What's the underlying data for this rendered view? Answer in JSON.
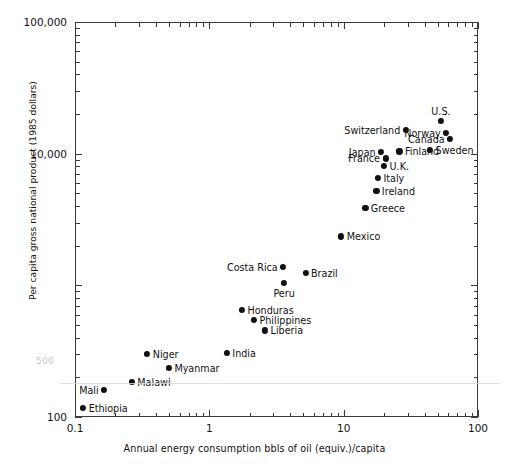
{
  "chart_data": {
    "type": "scatter",
    "title": "",
    "xlabel": "Annual energy consumption bbls of oil (equiv.)/capita",
    "ylabel": "Per capita gross national product (1985 dollars)",
    "xscale": "log",
    "yscale": "log",
    "xlim": [
      0.1,
      100
    ],
    "ylim": [
      100,
      100000
    ],
    "xticks": [
      "0.1",
      "1",
      "10",
      "100"
    ],
    "yticks": [
      "100",
      "1000",
      "10,000",
      "100,000"
    ],
    "ytick_labels_shown": [
      "100",
      "10,000",
      "100,000"
    ],
    "grid": false,
    "legend": false,
    "points": [
      {
        "name": "Ethiopia",
        "x": 0.115,
        "y": 118,
        "side": "right"
      },
      {
        "name": "Mali",
        "x": 0.165,
        "y": 160,
        "side": "left"
      },
      {
        "name": "Malawi",
        "x": 0.265,
        "y": 185,
        "side": "right"
      },
      {
        "name": "Myanmar",
        "x": 0.5,
        "y": 235,
        "side": "right"
      },
      {
        "name": "Niger",
        "x": 0.345,
        "y": 300,
        "side": "right"
      },
      {
        "name": "India",
        "x": 1.35,
        "y": 305,
        "side": "right"
      },
      {
        "name": "Liberia",
        "x": 2.6,
        "y": 455,
        "side": "right"
      },
      {
        "name": "Philippines",
        "x": 2.15,
        "y": 545,
        "side": "right"
      },
      {
        "name": "Honduras",
        "x": 1.75,
        "y": 650,
        "side": "right"
      },
      {
        "name": "Peru",
        "x": 3.6,
        "y": 1050,
        "side": "below"
      },
      {
        "name": "Costa Rica",
        "x": 3.55,
        "y": 1380,
        "side": "left"
      },
      {
        "name": "Brazil",
        "x": 5.2,
        "y": 1250,
        "side": "right"
      },
      {
        "name": "Mexico",
        "x": 9.6,
        "y": 2350,
        "side": "right"
      },
      {
        "name": "Greece",
        "x": 14.5,
        "y": 3900,
        "side": "right"
      },
      {
        "name": "Ireland",
        "x": 17.5,
        "y": 5200,
        "side": "right"
      },
      {
        "name": "Italy",
        "x": 18.0,
        "y": 6500,
        "side": "right"
      },
      {
        "name": "U.K.",
        "x": 20.0,
        "y": 8100,
        "side": "right"
      },
      {
        "name": "France",
        "x": 20.5,
        "y": 9200,
        "side": "left"
      },
      {
        "name": "Japan",
        "x": 19.0,
        "y": 10300,
        "side": "left"
      },
      {
        "name": "Finland",
        "x": 26.0,
        "y": 10400,
        "side": "right"
      },
      {
        "name": "Sweden",
        "x": 44.0,
        "y": 10700,
        "side": "right"
      },
      {
        "name": "Canada",
        "x": 62.0,
        "y": 13000,
        "side": "left"
      },
      {
        "name": "Norway",
        "x": 58.0,
        "y": 14300,
        "side": "left"
      },
      {
        "name": "Switzerland",
        "x": 29.0,
        "y": 15200,
        "side": "left"
      },
      {
        "name": "U.S.",
        "x": 53.0,
        "y": 17800,
        "side": "above"
      }
    ],
    "ghost_label": "500"
  },
  "colors": {
    "axis": "#3a3a3a",
    "point": "#101010",
    "text": "#111111",
    "background": "#ffffff"
  }
}
